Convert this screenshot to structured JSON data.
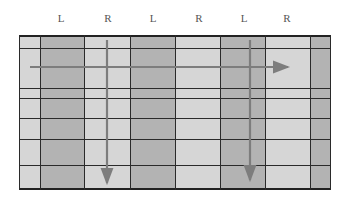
{
  "diagram": {
    "column_labels": [
      {
        "text": "L",
        "x": 61
      },
      {
        "text": "R",
        "x": 108
      },
      {
        "text": "L",
        "x": 153
      },
      {
        "text": "R",
        "x": 199
      },
      {
        "text": "L",
        "x": 244
      },
      {
        "text": "R",
        "x": 287
      }
    ],
    "colors": {
      "light": "#d6d6d6",
      "dark": "#b3b3b3",
      "grid_line": "#2a2a2a",
      "arrow": "#7d7d7d"
    },
    "columns": [
      {
        "x0": 19,
        "x1": 40,
        "shade": "light"
      },
      {
        "x0": 40,
        "x1": 84,
        "shade": "dark"
      },
      {
        "x0": 84,
        "x1": 130,
        "shade": "light"
      },
      {
        "x0": 130,
        "x1": 175,
        "shade": "dark"
      },
      {
        "x0": 175,
        "x1": 220,
        "shade": "light"
      },
      {
        "x0": 220,
        "x1": 265,
        "shade": "dark"
      },
      {
        "x0": 265,
        "x1": 310,
        "shade": "light"
      },
      {
        "x0": 310,
        "x1": 331,
        "shade": "dark"
      }
    ],
    "horizontal_lines_y": [
      48,
      88,
      98,
      118,
      139,
      165
    ],
    "arrows": [
      {
        "direction": "right",
        "x1": 30,
        "y1": 67,
        "x2": 288,
        "y2": 67
      },
      {
        "direction": "down",
        "x1": 107,
        "y1": 40,
        "x2": 107,
        "y2": 183
      },
      {
        "direction": "down",
        "x1": 250,
        "y1": 40,
        "x2": 250,
        "y2": 180
      }
    ]
  }
}
